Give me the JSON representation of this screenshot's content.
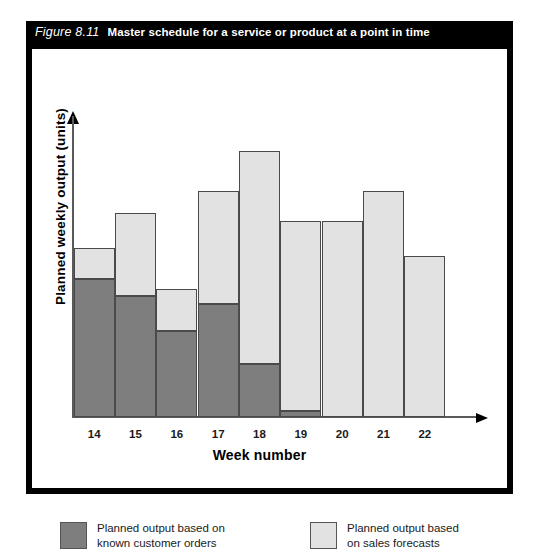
{
  "figure": {
    "number": "Figure 8.11",
    "title": "Master schedule for a service or product at a point in time"
  },
  "chart_data": {
    "type": "bar",
    "stacked": true,
    "title": "Master schedule for a service or product at a point in time",
    "xlabel": "Week number",
    "ylabel": "Planned weekly output (units)",
    "categories": [
      "14",
      "15",
      "16",
      "17",
      "18",
      "19",
      "20",
      "21",
      "22"
    ],
    "series": [
      {
        "name": "Planned output based on known customer orders",
        "color": "#7e7e7e",
        "values": [
          55,
          48,
          34,
          45,
          21,
          2,
          0,
          0,
          0
        ]
      },
      {
        "name": "Planned output based on sales forecasts",
        "color": "#e2e2e2",
        "values": [
          12,
          33,
          17,
          45,
          85,
          76,
          78,
          90,
          64
        ]
      }
    ],
    "totals": [
      67,
      81,
      51,
      90,
      106,
      78,
      78,
      90,
      64
    ],
    "ylim": [
      0,
      120
    ],
    "grid": false,
    "legend_position": "bottom",
    "axis_ticks_y": "none"
  },
  "axes": {
    "y_label": "Planned weekly output (units)",
    "x_label": "Week number",
    "x_ticks": [
      "14",
      "15",
      "16",
      "17",
      "18",
      "19",
      "20",
      "21",
      "22"
    ]
  },
  "legend": {
    "items": [
      {
        "label": "Planned output based on\nknown customer orders",
        "color": "#7e7e7e",
        "swatch": "dark-gray-swatch"
      },
      {
        "label": "Planned output based\non sales forecasts",
        "color": "#e2e2e2",
        "swatch": "light-gray-swatch"
      }
    ]
  },
  "colors": {
    "known_orders": "#7e7e7e",
    "sales_forecasts": "#e2e2e2",
    "frame": "#000000",
    "title_bar_bg": "#000000",
    "title_bar_text": "#ffffff",
    "axis": "#5a5a5a"
  }
}
